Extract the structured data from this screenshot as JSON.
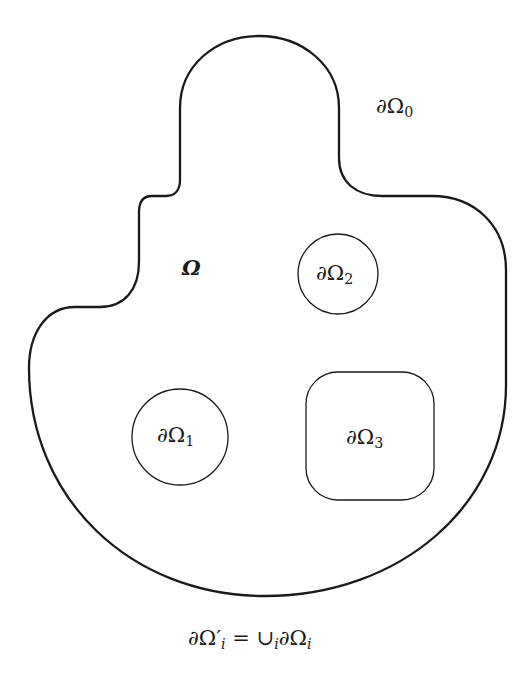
{
  "diagram": {
    "type": "domain-boundary-figure",
    "region_label": "Ω",
    "outer_boundary": {
      "label_base": "∂Ω",
      "label_sub": "0"
    },
    "inner_boundaries": [
      {
        "label_base": "∂Ω",
        "label_sub": "1",
        "shape": "circle"
      },
      {
        "label_base": "∂Ω",
        "label_sub": "2",
        "shape": "circle"
      },
      {
        "label_base": "∂Ω",
        "label_sub": "3",
        "shape": "rounded-square"
      }
    ],
    "caption": {
      "lhs_base": "∂Ω",
      "lhs_prime": "′",
      "lhs_sub": "i",
      "equals": " = ",
      "union": "∪",
      "union_sub": "i",
      "rhs_base": "∂Ω",
      "rhs_sub": "i"
    },
    "colors": {
      "stroke": "#1a1a1a",
      "background": "#ffffff"
    }
  }
}
